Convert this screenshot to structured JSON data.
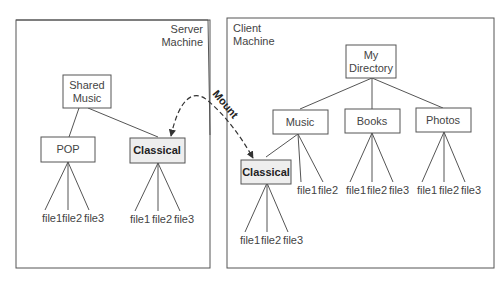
{
  "server": {
    "title_line1": "Server",
    "title_line2": "Machine",
    "root": {
      "line1": "Shared",
      "line2": "Music"
    },
    "pop": "POP",
    "classical": "Classical",
    "pop_files": [
      "file1",
      "file2",
      "file3"
    ],
    "classical_files": [
      "file1",
      "file2",
      "file3"
    ]
  },
  "client": {
    "title_line1": "Client",
    "title_line2": "Machine",
    "root": {
      "line1": "My",
      "line2": "Directory"
    },
    "music": "Music",
    "books": "Books",
    "photos": "Photos",
    "classical": "Classical",
    "music_files": [
      "file1",
      "file2"
    ],
    "books_files": [
      "file1",
      "file2",
      "file3"
    ],
    "photos_files": [
      "file1",
      "file2",
      "file3"
    ],
    "classical_files": [
      "file1",
      "file2",
      "file3"
    ]
  },
  "mount_label": "Mount",
  "colors": {
    "line": "#555555",
    "classical_fill": "#eeeeee"
  }
}
